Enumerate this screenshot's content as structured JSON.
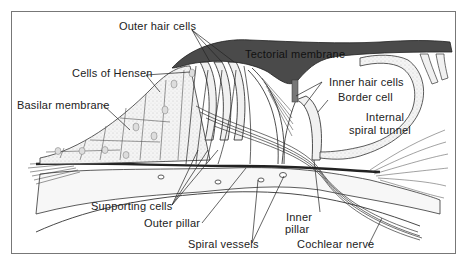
{
  "diagram": {
    "labels": {
      "outer_hair_cells": "Outer hair cells",
      "tectorial_membrane": "Tectorial membrane",
      "cells_of_hensen": "Cells of Hensen",
      "inner_hair_cells": "Inner hair cells",
      "border_cell": "Border cell",
      "basilar_membrane": "Basilar membrane",
      "internal_spiral_tunnel_1": "Internal",
      "internal_spiral_tunnel_2": "spiral tunnel",
      "supporting_cells": "Supporting cells",
      "outer_pillar": "Outer pillar",
      "inner_pillar_1": "Inner",
      "inner_pillar_2": "pillar",
      "spiral_vessels": "Spiral vessels",
      "cochlear_nerve": "Cochlear nerve"
    },
    "colors": {
      "tectorial": "#4a4a4a",
      "ink": "#222222",
      "cell_fill": "#f1f1f1",
      "frame": "#777777"
    }
  }
}
